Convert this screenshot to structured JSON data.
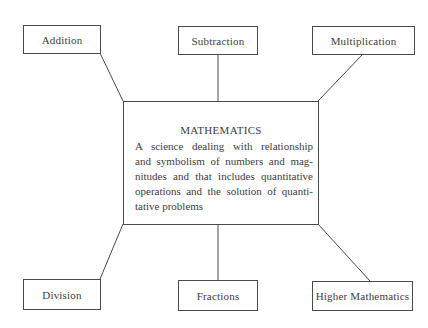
{
  "diagram": {
    "central": {
      "title": "MATHEMATICS",
      "description_lines": [
        "A science dealing with relationship",
        "and symbolism of numbers and mag-",
        "nitudes and that includes quantitative",
        "operations and the solution of quanti-",
        "tative problems"
      ]
    },
    "nodes": {
      "top_left": "Addition",
      "top_center": "Subtraction",
      "top_right": "Multiplication",
      "bottom_left": "Division",
      "bottom_center": "Fractions",
      "bottom_right": "Higher Mathematics"
    },
    "colors": {
      "line": "#4a4a4a",
      "text": "#3d3d3d",
      "background": "#ffffff"
    }
  }
}
